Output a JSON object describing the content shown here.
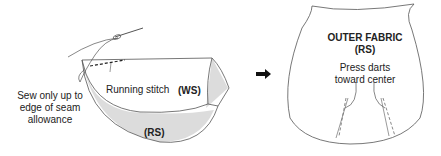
{
  "left_figure": {
    "side_note": [
      "Sew only up to",
      "edge of seam",
      "allowance"
    ],
    "stitch_label": "Running stitch",
    "ws_label": "(WS)",
    "rs_label": "(RS)"
  },
  "arrow": {
    "icon": "right-arrow-icon"
  },
  "right_figure": {
    "title_line1": "OUTER FABRIC",
    "title_line2": "(RS)",
    "note_line1": "Press darts",
    "note_line2": "toward center"
  },
  "colors": {
    "line": "#555555",
    "shade": "#dcdcdc",
    "text": "#222222"
  }
}
